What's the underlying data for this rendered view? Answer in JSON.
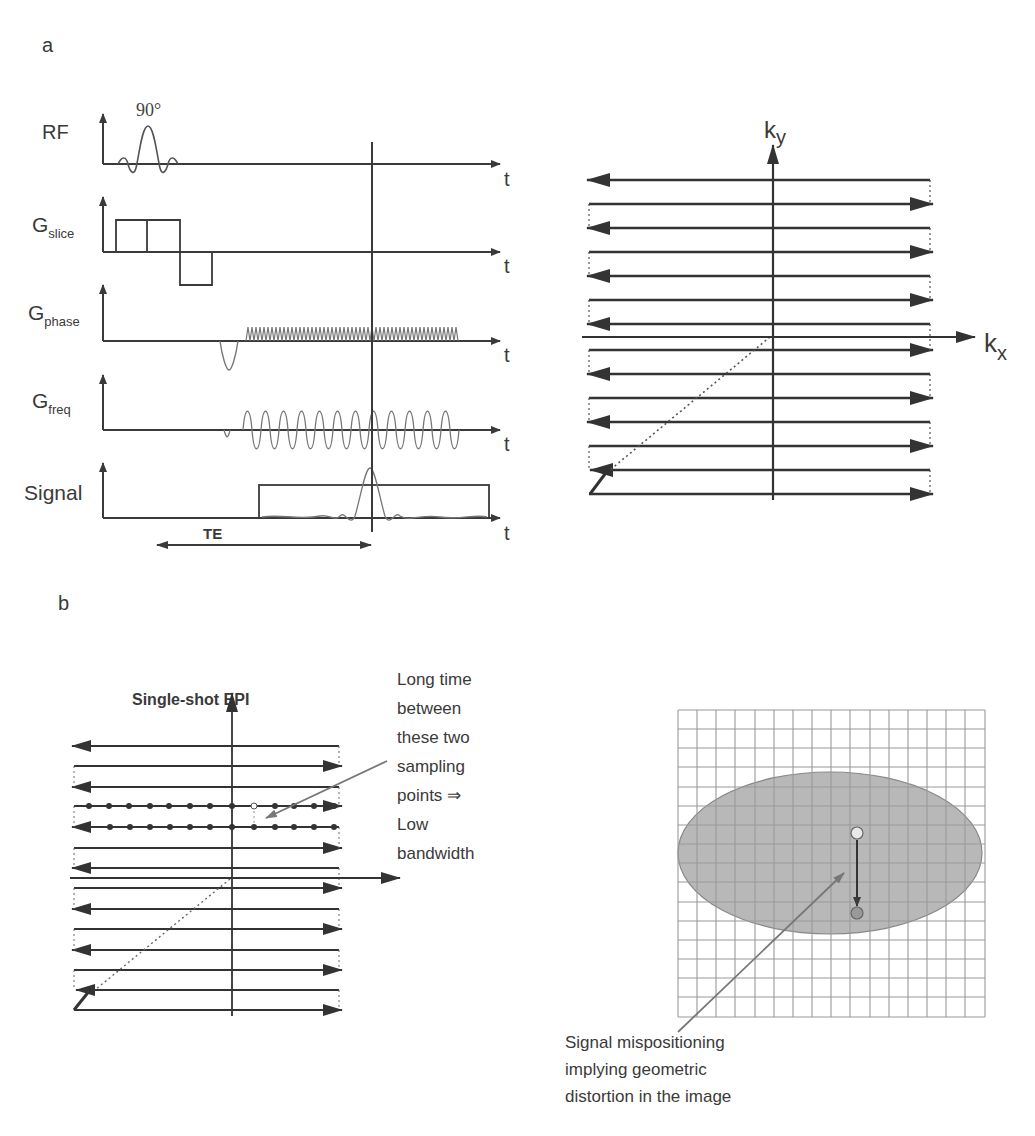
{
  "panel_a": {
    "label": "a",
    "sequence": {
      "rf_label": "RF",
      "flip_angle": "90°",
      "gslice_main": "G",
      "gslice_sub": "slice",
      "gphase_main": "G",
      "gphase_sub": "phase",
      "gfreq_main": "G",
      "gfreq_sub": "freq",
      "signal_label": "Signal",
      "time_label": "t",
      "te_label": "TE"
    },
    "kspace": {
      "ky_main": "k",
      "ky_sub": "y",
      "kx_main": "k",
      "kx_sub": "x"
    }
  },
  "panel_b": {
    "label": "b",
    "title": "Single-shot EPI",
    "annotation_lines": [
      "Long time",
      "between",
      "these two",
      "sampling",
      "points ⇒",
      "Low",
      "bandwidth"
    ],
    "distortion_lines": [
      "Signal mispositioning",
      "implying geometric",
      "distortion in the image"
    ]
  },
  "colors": {
    "stroke": "#3a3a3a",
    "light_stroke": "#777777",
    "ellipse_fill": "#b8b8b8",
    "grid": "#999999"
  }
}
